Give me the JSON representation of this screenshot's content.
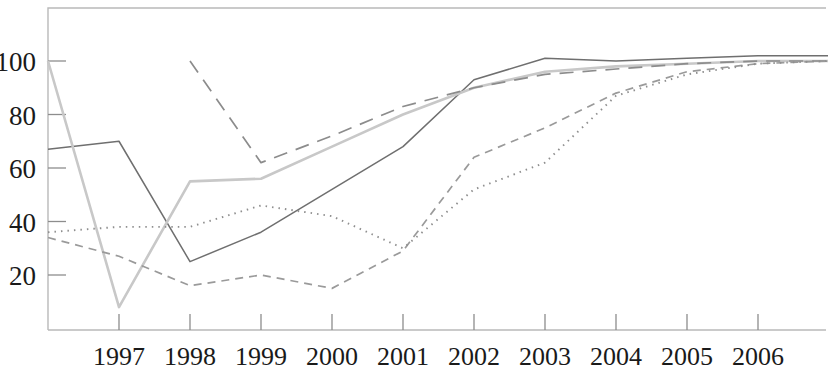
{
  "figure": {
    "kind": "line-chart",
    "background_color": "#ffffff",
    "frame_color": "#b9b9b9",
    "tick_color": "#8d8d8d",
    "label_color": "#1a1a1a"
  },
  "chart_data": {
    "type": "line",
    "title": "",
    "subtitle": "",
    "xlabel": "",
    "ylabel": "",
    "grid": false,
    "legend_position": "none",
    "x": [
      1996,
      1997,
      1998,
      1999,
      2000,
      2001,
      2002,
      2003,
      2004,
      2005,
      2006,
      2007
    ],
    "xtick_labels": [
      "1997",
      "1998",
      "1999",
      "2000",
      "2001",
      "2002",
      "2003",
      "2004",
      "2005",
      "2006"
    ],
    "xtick_values": [
      1997,
      1998,
      1999,
      2000,
      2001,
      2002,
      2003,
      2004,
      2005,
      2006
    ],
    "ytick_labels": [
      "20",
      "40",
      "60",
      "80",
      "100"
    ],
    "ytick_values": [
      20,
      40,
      60,
      80,
      100
    ],
    "xlim": [
      1996,
      2007
    ],
    "ylim": [
      0,
      113
    ],
    "series": [
      {
        "name": "series-solid",
        "style": "solid",
        "color": "#6f6f6f",
        "width": 1.5,
        "dash": "",
        "x": [
          1996,
          1997,
          1998,
          1999,
          2000,
          2001,
          2002,
          2003,
          2004,
          2005,
          2006,
          2007
        ],
        "values": [
          67,
          70,
          25,
          36,
          52,
          68,
          93,
          101,
          100,
          101,
          102,
          102
        ]
      },
      {
        "name": "series-light-solid",
        "style": "solid-light",
        "color": "#c8c8c8",
        "width": 2.6,
        "dash": "",
        "x": [
          1996,
          1997,
          1998,
          1999,
          2000,
          2001,
          2002,
          2003,
          2004,
          2005,
          2006,
          2007
        ],
        "values": [
          100,
          8,
          55,
          56,
          68,
          80,
          90,
          96,
          98,
          99,
          100,
          100
        ]
      },
      {
        "name": "series-long-dash",
        "style": "long-dash",
        "color": "#8c8c8c",
        "width": 1.7,
        "dash": "14 9",
        "x": [
          1998,
          1999,
          2000,
          2001,
          2002,
          2003,
          2004,
          2005,
          2006,
          2007
        ],
        "values": [
          100,
          62,
          72,
          83,
          90,
          95,
          97,
          99,
          100,
          100
        ]
      },
      {
        "name": "series-short-dash",
        "style": "short-dash",
        "color": "#9a9a9a",
        "width": 1.7,
        "dash": "8 6",
        "x": [
          1996,
          1997,
          1998,
          1999,
          2000,
          2001,
          2002,
          2003,
          2004,
          2005,
          2006,
          2007
        ],
        "values": [
          34,
          27,
          16,
          20,
          15,
          29,
          64,
          75,
          88,
          96,
          99,
          100
        ]
      },
      {
        "name": "series-dotted",
        "style": "dotted",
        "color": "#8f8f8f",
        "width": 1.9,
        "dash": "1.5 5",
        "x": [
          1996,
          1997,
          1998,
          1999,
          2000,
          2001,
          2002,
          2003,
          2004,
          2005,
          2006,
          2007
        ],
        "values": [
          36,
          38,
          38,
          46,
          42,
          30,
          52,
          62,
          87,
          95,
          99,
          100
        ]
      }
    ]
  }
}
